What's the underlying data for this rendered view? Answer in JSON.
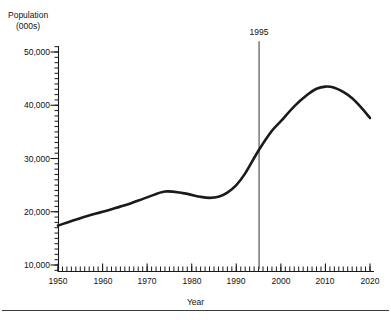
{
  "chart_data": {
    "type": "line",
    "title": "Population (000s)",
    "title_line1": "Population",
    "title_line2": "(000s)",
    "xlabel": "Year",
    "ylabel": "Population (000s)",
    "xlim": [
      1950,
      2020
    ],
    "ylim": [
      10000,
      50000
    ],
    "grid": false,
    "legend": "none",
    "x_ticks": [
      1950,
      1960,
      1970,
      1980,
      1990,
      2000,
      2010,
      2020
    ],
    "x_tick_labels": [
      "1950",
      "1960",
      "1970",
      "1980",
      "1990",
      "2000",
      "2010",
      "2020"
    ],
    "x_minor_tick_interval": 1,
    "y_ticks": [
      10000,
      20000,
      30000,
      40000,
      50000
    ],
    "y_tick_labels": [
      "10,000",
      "20,000",
      "30,000",
      "40,000",
      "50,000"
    ],
    "y_minor_tick_interval": 1000,
    "series": [
      {
        "name": "Population",
        "color": "#1a1a1a",
        "line_width": 2.6,
        "x": [
          1950,
          1955,
          1960,
          1965,
          1970,
          1974,
          1978,
          1982,
          1984,
          1986,
          1988,
          1990,
          1992,
          1995,
          1998,
          2000,
          2003,
          2006,
          2008,
          2010,
          2012,
          2014,
          2016,
          2018,
          2020
        ],
        "values": [
          17400,
          18800,
          20000,
          21200,
          22700,
          23800,
          23500,
          22800,
          22600,
          22800,
          23600,
          25000,
          27200,
          31500,
          35200,
          37000,
          39800,
          42000,
          43100,
          43500,
          43300,
          42500,
          41300,
          39600,
          37600
        ]
      }
    ],
    "annotations": [
      {
        "type": "vertical-reference-line",
        "name": "year-1995-marker",
        "label": "1995",
        "x": 1995,
        "color": "#555555",
        "y_top": 52000,
        "y_bottom": 9200
      }
    ]
  }
}
